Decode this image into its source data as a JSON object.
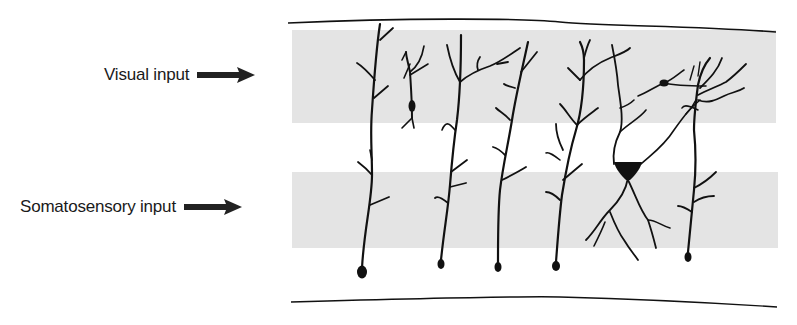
{
  "figure": {
    "type": "neuroanatomy-schematic",
    "colors": {
      "background": "#ffffff",
      "band": "#e4e4e4",
      "ink": "#111111",
      "label": "#1a1a1a"
    }
  },
  "labels": {
    "visual": {
      "text": "Visual input",
      "icon": "arrow-right-icon"
    },
    "somatosensory": {
      "text": "Somatosensory input",
      "icon": "arrow-right-icon"
    }
  },
  "layers": [
    {
      "name": "visual-input-band",
      "y_top": 30,
      "y_bottom": 123
    },
    {
      "name": "somatosensory-input-band",
      "y_top": 172,
      "y_bottom": 248
    }
  ],
  "neurons": [
    {
      "id": 1,
      "kind": "pyramidal-inverted",
      "soma_x": 362,
      "soma_y": 272
    },
    {
      "id": 2,
      "kind": "small-bipolar",
      "soma_x": 412,
      "soma_y": 106
    },
    {
      "id": 3,
      "kind": "pyramidal-inverted",
      "soma_x": 441,
      "soma_y": 264
    },
    {
      "id": 4,
      "kind": "pyramidal-inverted",
      "soma_x": 498,
      "soma_y": 267
    },
    {
      "id": 5,
      "kind": "pyramidal-inverted",
      "soma_x": 556,
      "soma_y": 266
    },
    {
      "id": 6,
      "kind": "pyramidal-triangular",
      "soma_x": 628,
      "soma_y": 168
    },
    {
      "id": 7,
      "kind": "small-stellate",
      "soma_x": 664,
      "soma_y": 83
    },
    {
      "id": 8,
      "kind": "pyramidal-inverted",
      "soma_x": 688,
      "soma_y": 257
    }
  ]
}
